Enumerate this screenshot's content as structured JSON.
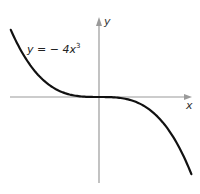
{
  "chart_data": {
    "type": "line",
    "title": "",
    "xlabel": "x",
    "ylabel": "y",
    "xlim": [
      -1.05,
      1.1
    ],
    "ylim": [
      -5.0,
      4.8
    ],
    "grid": false,
    "ticks": false,
    "series": [
      {
        "name": "y = − 4x³",
        "function": "y = -4x^3",
        "x": [
          -1.05,
          -0.9,
          -0.75,
          -0.6,
          -0.45,
          -0.3,
          -0.15,
          0,
          0.15,
          0.3,
          0.45,
          0.6,
          0.75,
          0.9,
          1.05,
          1.1
        ],
        "y": [
          4.63,
          2.92,
          1.69,
          0.86,
          0.36,
          0.11,
          0.01,
          0,
          -0.01,
          -0.11,
          -0.36,
          -0.86,
          -1.69,
          -2.92,
          -4.63,
          -5.32
        ]
      }
    ],
    "annotations": [
      {
        "text_prefix": "y = − 4x",
        "superscript": "3",
        "position": "upper-left"
      }
    ]
  },
  "labels": {
    "x_axis": "x",
    "y_axis": "y",
    "equation_prefix": "y = − 4x",
    "equation_exponent": "3"
  }
}
